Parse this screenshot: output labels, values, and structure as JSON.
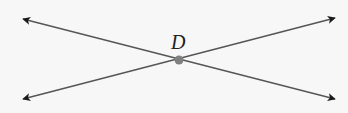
{
  "diagram": {
    "type": "intersecting-lines",
    "point_label": "D",
    "colors": {
      "background": "#f7f7f7",
      "line": "#555555",
      "arrowhead": "#1a1a1a",
      "point": "#808080"
    },
    "lines": [
      {
        "name": "line-1",
        "from": [
          23,
          19
        ],
        "to": [
          335,
          99
        ]
      },
      {
        "name": "line-2",
        "from": [
          23,
          99
        ],
        "to": [
          335,
          18
        ]
      }
    ],
    "intersection": {
      "x": 179,
      "y": 60
    }
  }
}
